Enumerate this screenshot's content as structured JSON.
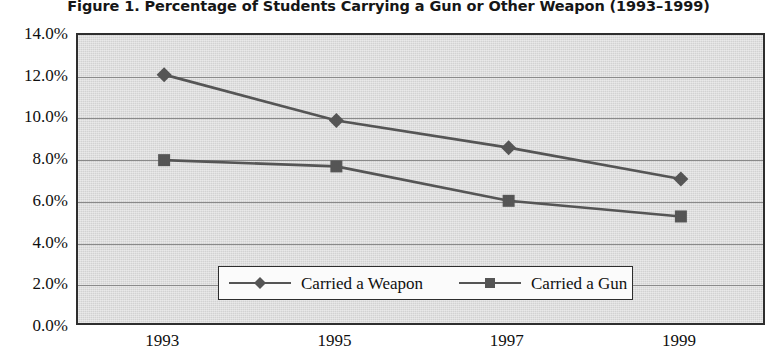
{
  "chart_data": {
    "type": "line",
    "title": "Figure 1.  Percentage of Students Carrying a Gun or Other Weapon (1993–1999)",
    "xlabel": "",
    "ylabel": "",
    "categories": [
      "1993",
      "1995",
      "1997",
      "1999"
    ],
    "x": [
      1993,
      1995,
      1997,
      1999
    ],
    "series": [
      {
        "name": "Carried a Weapon",
        "marker": "diamond",
        "color": "#555555",
        "values": [
          12.1,
          9.9,
          8.6,
          7.1
        ]
      },
      {
        "name": "Carried a Gun",
        "marker": "square",
        "color": "#555555",
        "values": [
          8.0,
          7.7,
          6.05,
          5.3
        ]
      }
    ],
    "ylim": [
      0.0,
      14.0
    ],
    "ytick_values": [
      0.0,
      2.0,
      4.0,
      6.0,
      8.0,
      10.0,
      12.0,
      14.0
    ],
    "ytick_labels": [
      "0.0%",
      "2.0%",
      "4.0%",
      "6.0%",
      "8.0%",
      "10.0%",
      "12.0%",
      "14.0%"
    ],
    "xtick_labels": [
      "1993",
      "1995",
      "1997",
      "1999"
    ],
    "grid": true,
    "grid_axis": "y",
    "legend_position": "inside-bottom-center",
    "legend_entries": [
      "Carried a Weapon",
      "Carried a Gun"
    ],
    "plot_background_color": "#d8d8d8",
    "gridline_color": "#8a8a8a",
    "axis_border_color": "#2e2e2e"
  }
}
